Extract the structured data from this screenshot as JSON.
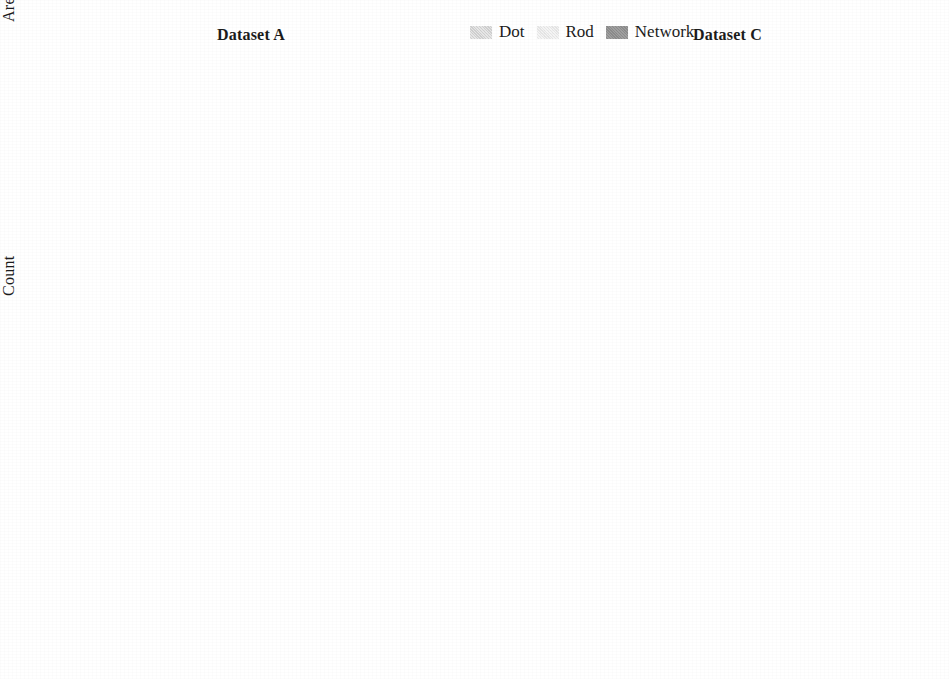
{
  "figure": {
    "series": [
      {
        "key": "dot",
        "label": "Dot",
        "color": "#cdcdcd"
      },
      {
        "key": "rod",
        "label": "Rod",
        "color": "#e4e4e4"
      },
      {
        "key": "network",
        "label": "Network",
        "color": "#8c8c8c"
      }
    ],
    "methods": [
      "GT",
      "nnUNET",
      "SegResNet",
      "UNETR",
      "SwinUNETR",
      "U-Mamba",
      "CMU-Net"
    ]
  },
  "legend": {
    "dot_label": "Dot",
    "rod_label": "Rod",
    "network_label": "Network"
  },
  "panels": {
    "area_a": {
      "title": "Dataset A",
      "ylabel": "Area (Pixels)",
      "ticks": [
        "8000",
        "7000",
        "6000",
        "5000",
        "4000",
        "3000",
        "2000",
        "1000",
        "0"
      ]
    },
    "area_c": {
      "title": "Dataset C",
      "ylabel": "",
      "ticks": [
        "3500",
        "3000",
        "2500",
        "2000",
        "1500",
        "1000",
        "500",
        "0"
      ]
    },
    "count_a": {
      "title": "",
      "ylabel": "Count",
      "ticks": [
        "700",
        "600",
        "500",
        "400",
        "300",
        "200",
        "100",
        "0"
      ]
    },
    "count_c": {
      "title": "",
      "ylabel": "",
      "ticks": [
        "1400",
        "1200",
        "1000",
        "800",
        "600",
        "400",
        "200",
        "0"
      ]
    }
  },
  "chart_data": [
    {
      "id": "area_a",
      "type": "box",
      "title": "Dataset A",
      "xlabel": "",
      "ylabel": "Area (Pixels)",
      "ylim": [
        0,
        8000
      ],
      "ytick_step": 1000,
      "grid": false,
      "legend_position": "none",
      "categories": [
        "GT",
        "nnUNET",
        "SegResNet",
        "UNETR",
        "SwinUNETR",
        "U-Mamba",
        "CMU-Net"
      ],
      "series": [
        {
          "name": "Dot",
          "boxes": [
            {
              "category": "GT",
              "q1": 40,
              "median": 70,
              "q3": 110,
              "whisker_low": 5,
              "whisker_high": 190,
              "outlier_max": 260
            },
            {
              "category": "nnUNET",
              "q1": 40,
              "median": 70,
              "q3": 110,
              "whisker_low": 5,
              "whisker_high": 190,
              "outlier_max": 260
            },
            {
              "category": "SegResNet",
              "q1": 40,
              "median": 70,
              "q3": 110,
              "whisker_low": 5,
              "whisker_high": 190,
              "outlier_max": 260
            },
            {
              "category": "UNETR",
              "q1": 45,
              "median": 75,
              "q3": 115,
              "whisker_low": 5,
              "whisker_high": 200,
              "outlier_max": 270
            },
            {
              "category": "SwinUNETR",
              "q1": 40,
              "median": 70,
              "q3": 110,
              "whisker_low": 5,
              "whisker_high": 190,
              "outlier_max": 260
            },
            {
              "category": "U-Mamba",
              "q1": 40,
              "median": 70,
              "q3": 110,
              "whisker_low": 5,
              "whisker_high": 190,
              "outlier_max": 260
            },
            {
              "category": "CMU-Net",
              "q1": 40,
              "median": 70,
              "q3": 110,
              "whisker_low": 5,
              "whisker_high": 190,
              "outlier_max": 260
            }
          ]
        },
        {
          "name": "Rod",
          "boxes": [
            {
              "category": "GT",
              "q1": 90,
              "median": 150,
              "q3": 230,
              "whisker_low": 20,
              "whisker_high": 420,
              "outlier_max": 560
            },
            {
              "category": "nnUNET",
              "q1": 90,
              "median": 150,
              "q3": 230,
              "whisker_low": 20,
              "whisker_high": 420,
              "outlier_max": 560
            },
            {
              "category": "SegResNet",
              "q1": 90,
              "median": 150,
              "q3": 230,
              "whisker_low": 20,
              "whisker_high": 420,
              "outlier_max": 560
            },
            {
              "category": "UNETR",
              "q1": 95,
              "median": 160,
              "q3": 240,
              "whisker_low": 20,
              "whisker_high": 430,
              "outlier_max": 570
            },
            {
              "category": "SwinUNETR",
              "q1": 90,
              "median": 150,
              "q3": 230,
              "whisker_low": 20,
              "whisker_high": 420,
              "outlier_max": 560
            },
            {
              "category": "U-Mamba",
              "q1": 90,
              "median": 150,
              "q3": 230,
              "whisker_low": 20,
              "whisker_high": 420,
              "outlier_max": 560
            },
            {
              "category": "CMU-Net",
              "q1": 90,
              "median": 150,
              "q3": 230,
              "whisker_low": 20,
              "whisker_high": 420,
              "outlier_max": 560
            }
          ]
        },
        {
          "name": "Network",
          "boxes": [
            {
              "category": "GT",
              "q1": 620,
              "median": 1000,
              "q3": 1400,
              "whisker_low": 520,
              "whisker_high": 2350,
              "outlier_max": 5900
            },
            {
              "category": "nnUNET",
              "q1": 620,
              "median": 1000,
              "q3": 1400,
              "whisker_low": 520,
              "whisker_high": 2300,
              "outlier_max": 5100
            },
            {
              "category": "SegResNet",
              "q1": 620,
              "median": 1000,
              "q3": 1400,
              "whisker_low": 520,
              "whisker_high": 2300,
              "outlier_max": 5200
            },
            {
              "category": "UNETR",
              "q1": 630,
              "median": 1010,
              "q3": 1410,
              "whisker_low": 530,
              "whisker_high": 2350,
              "outlier_max": 5700
            },
            {
              "category": "SwinUNETR",
              "q1": 620,
              "median": 1000,
              "q3": 1390,
              "whisker_low": 520,
              "whisker_high": 2300,
              "outlier_max": 4600
            },
            {
              "category": "U-Mamba",
              "q1": 620,
              "median": 1000,
              "q3": 1390,
              "whisker_low": 520,
              "whisker_high": 2300,
              "outlier_max": 5800
            },
            {
              "category": "CMU-Net",
              "q1": 620,
              "median": 1000,
              "q3": 1380,
              "whisker_low": 520,
              "whisker_high": 2300,
              "outlier_max": 5000
            }
          ]
        }
      ]
    },
    {
      "id": "area_c",
      "type": "box",
      "title": "Dataset C",
      "xlabel": "",
      "ylabel": "",
      "ylim": [
        0,
        3500
      ],
      "ytick_step": 500,
      "grid": false,
      "legend_position": "top-center",
      "categories": [
        "GT",
        "nnUNET",
        "SegResNet",
        "UNETR",
        "SwinUNETR",
        "U-Mamba",
        "CMU-Net"
      ],
      "series": [
        {
          "name": "Dot",
          "boxes": [
            {
              "category": "GT",
              "q1": 30,
              "median": 55,
              "q3": 90,
              "whisker_low": 5,
              "whisker_high": 160,
              "outlier_max": 230
            },
            {
              "category": "nnUNET",
              "q1": 30,
              "median": 55,
              "q3": 90,
              "whisker_low": 5,
              "whisker_high": 160,
              "outlier_max": 230
            },
            {
              "category": "SegResNet",
              "q1": 30,
              "median": 55,
              "q3": 90,
              "whisker_low": 5,
              "whisker_high": 160,
              "outlier_max": 230
            },
            {
              "category": "UNETR",
              "q1": 32,
              "median": 58,
              "q3": 95,
              "whisker_low": 5,
              "whisker_high": 165,
              "outlier_max": 240
            },
            {
              "category": "SwinUNETR",
              "q1": 30,
              "median": 55,
              "q3": 90,
              "whisker_low": 5,
              "whisker_high": 160,
              "outlier_max": 230
            },
            {
              "category": "U-Mamba",
              "q1": 30,
              "median": 55,
              "q3": 90,
              "whisker_low": 5,
              "whisker_high": 160,
              "outlier_max": 230
            },
            {
              "category": "CMU-Net",
              "q1": 30,
              "median": 55,
              "q3": 90,
              "whisker_low": 5,
              "whisker_high": 160,
              "outlier_max": 230
            }
          ]
        },
        {
          "name": "Rod",
          "boxes": [
            {
              "category": "GT",
              "q1": 80,
              "median": 140,
              "q3": 215,
              "whisker_low": 15,
              "whisker_high": 380,
              "outlier_max": 520
            },
            {
              "category": "nnUNET",
              "q1": 80,
              "median": 140,
              "q3": 215,
              "whisker_low": 15,
              "whisker_high": 380,
              "outlier_max": 520
            },
            {
              "category": "SegResNet",
              "q1": 80,
              "median": 140,
              "q3": 215,
              "whisker_low": 15,
              "whisker_high": 380,
              "outlier_max": 520
            },
            {
              "category": "UNETR",
              "q1": 85,
              "median": 145,
              "q3": 225,
              "whisker_low": 15,
              "whisker_high": 390,
              "outlier_max": 540
            },
            {
              "category": "SwinUNETR",
              "q1": 80,
              "median": 140,
              "q3": 215,
              "whisker_low": 15,
              "whisker_high": 380,
              "outlier_max": 520
            },
            {
              "category": "U-Mamba",
              "q1": 80,
              "median": 140,
              "q3": 215,
              "whisker_low": 15,
              "whisker_high": 380,
              "outlier_max": 520
            },
            {
              "category": "CMU-Net",
              "q1": 80,
              "median": 140,
              "q3": 215,
              "whisker_low": 15,
              "whisker_high": 380,
              "outlier_max": 520
            }
          ]
        },
        {
          "name": "Network",
          "boxes": [
            {
              "category": "GT",
              "q1": 520,
              "median": 760,
              "q3": 1030,
              "whisker_low": 430,
              "whisker_high": 1450,
              "outlier_max": 2280
            },
            {
              "category": "nnUNET",
              "q1": 500,
              "median": 690,
              "q3": 870,
              "whisker_low": 420,
              "whisker_high": 1350,
              "outlier_max": 2240
            },
            {
              "category": "SegResNet",
              "q1": 500,
              "median": 690,
              "q3": 870,
              "whisker_low": 420,
              "whisker_high": 1360,
              "outlier_max": 2050
            },
            {
              "category": "UNETR",
              "q1": 520,
              "median": 760,
              "q3": 1010,
              "whisker_low": 430,
              "whisker_high": 1450,
              "outlier_max": 2170
            },
            {
              "category": "SwinUNETR",
              "q1": 500,
              "median": 690,
              "q3": 880,
              "whisker_low": 420,
              "whisker_high": 1420,
              "outlier_max": 2180
            },
            {
              "category": "U-Mamba",
              "q1": 500,
              "median": 690,
              "q3": 880,
              "whisker_low": 420,
              "whisker_high": 1400,
              "outlier_max": 2100
            },
            {
              "category": "CMU-Net",
              "q1": 500,
              "median": 690,
              "q3": 880,
              "whisker_low": 420,
              "whisker_high": 1520,
              "outlier_max": 2230
            }
          ]
        }
      ]
    },
    {
      "id": "count_a",
      "type": "bar",
      "title": "",
      "xlabel": "",
      "ylabel": "Count",
      "ylim": [
        0,
        700
      ],
      "ytick_step": 100,
      "grid": false,
      "legend_position": "none",
      "categories": [
        "GT",
        "nnUNET",
        "SegResNet",
        "UNETR",
        "SwinUNETR",
        "U-Mamba",
        "CMU-Net"
      ],
      "series": [
        {
          "name": "Dot",
          "values": [
            678,
            678,
            718,
            668,
            695,
            675,
            628
          ]
        },
        {
          "name": "Rod",
          "values": [
            678,
            700,
            710,
            688,
            696,
            688,
            628
          ]
        },
        {
          "name": "Network",
          "values": [
            278,
            265,
            268,
            266,
            270,
            266,
            272
          ]
        }
      ]
    },
    {
      "id": "count_c",
      "type": "bar",
      "title": "",
      "xlabel": "",
      "ylabel": "",
      "ylim": [
        0,
        1400
      ],
      "ytick_step": 200,
      "grid": false,
      "legend_position": "none",
      "categories": [
        "GT",
        "nnUNET",
        "SegResNet",
        "UNETR",
        "SwinUNETR",
        "U-Mamba",
        "CMU-Net"
      ],
      "series": [
        {
          "name": "Dot",
          "values": [
            1100,
            1290,
            1360,
            1165,
            1300,
            1250,
            1265
          ]
        },
        {
          "name": "Rod",
          "values": [
            510,
            530,
            525,
            535,
            555,
            545,
            485
          ]
        },
        {
          "name": "Network",
          "values": [
            62,
            58,
            56,
            58,
            66,
            62,
            58
          ]
        }
      ]
    }
  ]
}
